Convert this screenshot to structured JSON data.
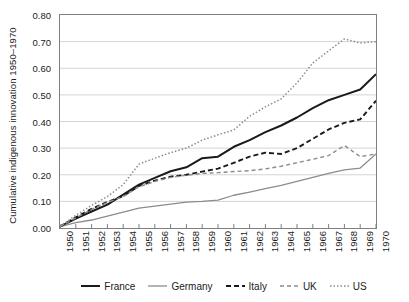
{
  "chart_data": {
    "type": "line",
    "title": "",
    "xlabel": "",
    "ylabel": "Cumulative indigenous innovation 1950–1970",
    "xlim": [
      1950,
      1970
    ],
    "ylim": [
      0.0,
      0.8
    ],
    "grid": "horizontal",
    "legend_position": "bottom",
    "x": [
      1950,
      1951,
      1952,
      1953,
      1954,
      1955,
      1956,
      1957,
      1958,
      1959,
      1960,
      1961,
      1962,
      1963,
      1964,
      1965,
      1966,
      1967,
      1968,
      1969,
      1970
    ],
    "y_ticks": [
      "0.00",
      "0.10",
      "0.20",
      "0.30",
      "0.40",
      "0.50",
      "0.60",
      "0.70",
      "0.80"
    ],
    "y_tick_values": [
      0.0,
      0.1,
      0.2,
      0.3,
      0.4,
      0.5,
      0.6,
      0.7,
      0.8
    ],
    "x_ticks": [
      "1950",
      "1951",
      "1952",
      "1953",
      "1954",
      "1955",
      "1956",
      "1957",
      "1958",
      "1959",
      "1960",
      "1961",
      "1962",
      "1963",
      "1964",
      "1965",
      "1966",
      "1967",
      "1968",
      "1969",
      "1970"
    ],
    "series": [
      {
        "name": "France",
        "color": "#1a1a1a",
        "style": "solid",
        "width": 2.0,
        "values": [
          0.005,
          0.035,
          0.062,
          0.088,
          0.125,
          0.163,
          0.188,
          0.213,
          0.228,
          0.262,
          0.268,
          0.305,
          0.33,
          0.36,
          0.385,
          0.415,
          0.45,
          0.48,
          0.5,
          0.52,
          0.578
        ]
      },
      {
        "name": "Germany",
        "color": "#8c8c8c",
        "style": "solid",
        "width": 1.3,
        "values": [
          0.005,
          0.02,
          0.03,
          0.045,
          0.06,
          0.075,
          0.082,
          0.09,
          0.097,
          0.1,
          0.105,
          0.123,
          0.135,
          0.148,
          0.16,
          0.175,
          0.19,
          0.205,
          0.218,
          0.225,
          0.278
        ]
      },
      {
        "name": "Italy",
        "color": "#1a1a1a",
        "style": "dashed",
        "width": 1.9,
        "values": [
          0.005,
          0.04,
          0.072,
          0.098,
          0.12,
          0.158,
          0.178,
          0.193,
          0.2,
          0.212,
          0.223,
          0.245,
          0.268,
          0.283,
          0.278,
          0.3,
          0.335,
          0.37,
          0.395,
          0.408,
          0.478
        ]
      },
      {
        "name": "UK",
        "color": "#8c8c8c",
        "style": "dashed",
        "width": 1.4,
        "values": [
          0.005,
          0.038,
          0.07,
          0.096,
          0.118,
          0.155,
          0.175,
          0.19,
          0.198,
          0.205,
          0.208,
          0.212,
          0.215,
          0.222,
          0.232,
          0.245,
          0.258,
          0.272,
          0.31,
          0.268,
          0.278
        ]
      },
      {
        "name": "US",
        "color": "#8c8c8c",
        "style": "dotted",
        "width": 1.5,
        "values": [
          0.005,
          0.048,
          0.085,
          0.118,
          0.163,
          0.24,
          0.262,
          0.283,
          0.3,
          0.33,
          0.35,
          0.368,
          0.42,
          0.455,
          0.485,
          0.545,
          0.62,
          0.665,
          0.71,
          0.695,
          0.7
        ]
      }
    ]
  }
}
